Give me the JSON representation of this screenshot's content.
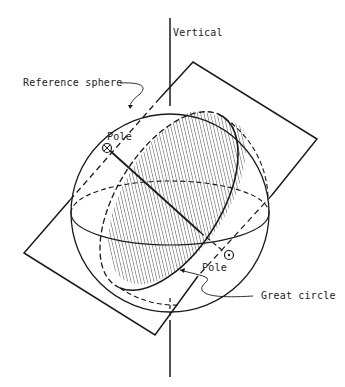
{
  "diagram": {
    "labels": {
      "vertical": "Vertical",
      "reference_sphere": "Reference sphere",
      "pole_upper": "Pole",
      "pole_lower": "Pole",
      "great_circle": "Great circle"
    },
    "colors": {
      "ink": "#1a1a1a",
      "background": "#ffffff"
    }
  }
}
